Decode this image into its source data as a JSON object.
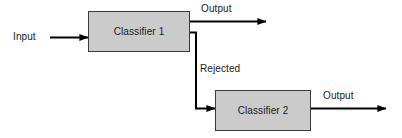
{
  "diagram": {
    "type": "flowchart",
    "background_color": "#ffffff",
    "node_fill_color": "#cbcbcb",
    "node_border_color": "#3a3a3a",
    "line_color": "#000000",
    "nodes": [
      {
        "id": "classifier-1",
        "label": "Classifier 1"
      },
      {
        "id": "classifier-2",
        "label": "Classifier 2"
      }
    ],
    "edge_labels": {
      "input": "Input",
      "output_1": "Output",
      "rejected": "Rejected",
      "output_2": "Output"
    }
  }
}
